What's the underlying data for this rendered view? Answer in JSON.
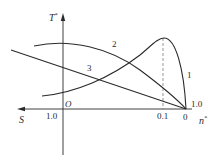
{
  "diagram": {
    "axes": {
      "y_axis_label": "T",
      "y_axis_label_sup": "*",
      "x_axis_left_label": "S",
      "x_axis_right_label": "n",
      "x_axis_right_label_sup": "*",
      "origin_label": "O"
    },
    "tick_labels": {
      "s_one": "1.0",
      "n_point_one": "0.1",
      "n_zero": "0",
      "vertex_one": "1.0"
    },
    "curves": [
      {
        "id": "1",
        "label": "1",
        "description": "rising curve peaking above n*=0.1 then falling to n*=0"
      },
      {
        "id": "2",
        "label": "2",
        "description": "arched curve descending to n*=0"
      },
      {
        "id": "3",
        "label": "3",
        "description": "straight line descending to n*=0"
      }
    ],
    "colors": {
      "line": "#2a2a2a",
      "dashed": "#8a8a8a",
      "background": "#ffffff"
    }
  }
}
